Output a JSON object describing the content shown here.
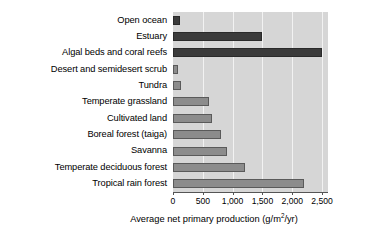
{
  "chart_data": {
    "type": "bar",
    "orientation": "horizontal",
    "title": "",
    "xlabel": "Average net primary production (g/m2/yr)",
    "ylabel": "",
    "xlim": [
      0,
      2600
    ],
    "xticks": [
      0,
      500,
      1000,
      1500,
      2000,
      2500
    ],
    "xtick_labels": [
      "0",
      "500",
      "1,000",
      "1,500",
      "2,000",
      "2,500"
    ],
    "grid": true,
    "legend": "none",
    "categories": [
      "Open ocean",
      "Estuary",
      "Algal beds and coral reefs",
      "Desert and semidesert scrub",
      "Tundra",
      "Temperate grassland",
      "Cultivated land",
      "Boreal forest (taiga)",
      "Savanna",
      "Temperate deciduous forest",
      "Tropical rain forest"
    ],
    "values": [
      125,
      1500,
      2500,
      90,
      140,
      600,
      650,
      800,
      900,
      1200,
      2200
    ],
    "bar_styles": [
      "dark",
      "dark",
      "dark",
      "mid",
      "mid",
      "mid",
      "mid",
      "mid",
      "mid",
      "mid",
      "mid"
    ],
    "colors": {
      "bar_dark": "#3b3b3b",
      "bar_mid": "#8c8c8c",
      "plot_background": "#d6d6d6",
      "gridline": "#f2f2f2",
      "axis": "#555555",
      "text": "#000000"
    },
    "axis_title_parts": {
      "before": "Average net primary production (g/m",
      "exponent": "2",
      "after": "/yr)"
    }
  }
}
